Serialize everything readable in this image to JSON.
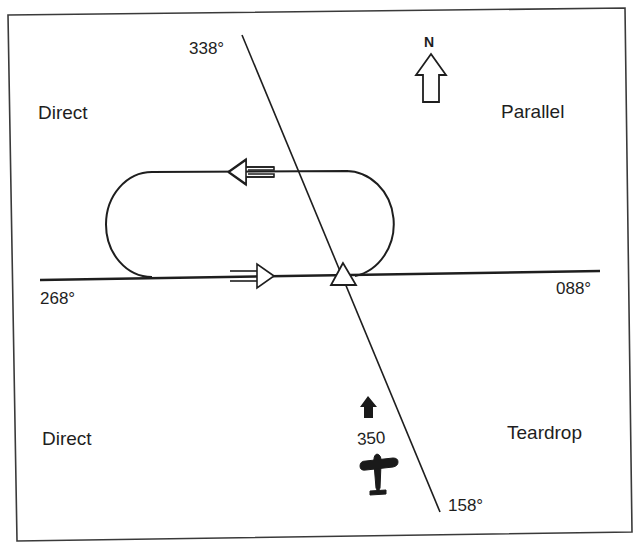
{
  "diagram": {
    "colors": {
      "ink": "#1e1e1e",
      "frame": "#3a3a3a",
      "background": "#ffffff"
    },
    "sectors": [
      {
        "id": "direct-top",
        "label": "Direct"
      },
      {
        "id": "parallel",
        "label": "Parallel"
      },
      {
        "id": "direct-bottom",
        "label": "Direct"
      },
      {
        "id": "teardrop",
        "label": "Teardrop"
      }
    ],
    "radials": {
      "r338": "338°",
      "r158": "158°",
      "r268": "268°",
      "r088": "088°"
    },
    "north_arrow": {
      "label": "N",
      "icon": "north-arrow-icon"
    },
    "aircraft": {
      "heading_label": "350",
      "icon": "airplane-icon",
      "heading_icon": "heading-arrow-icon"
    },
    "holding_pattern": {
      "inbound_arrow_icon": "inbound-arrow-icon",
      "outbound_arrow_icon": "outbound-arrow-icon",
      "fix_icon": "holding-fix-triangle-icon"
    }
  }
}
